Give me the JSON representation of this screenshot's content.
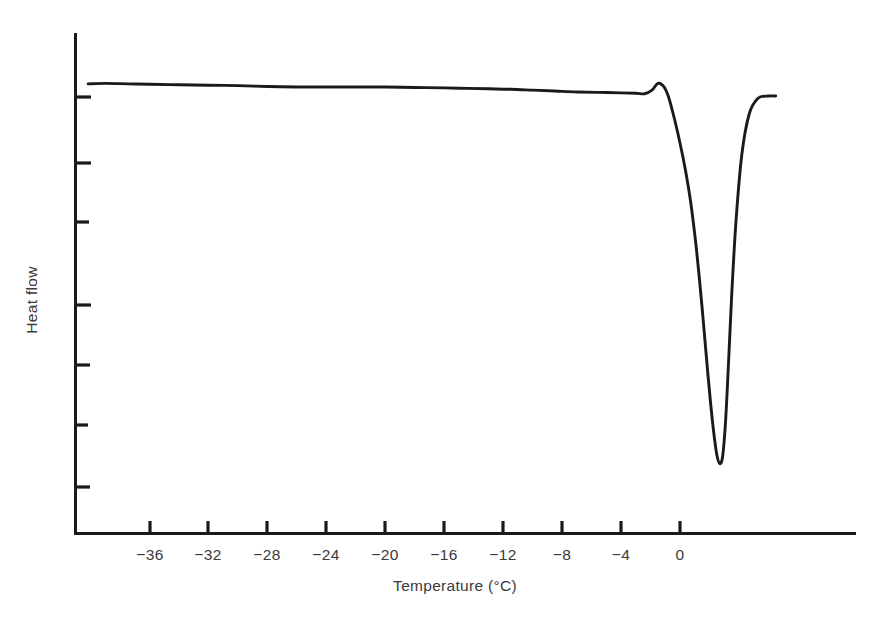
{
  "chart_data": {
    "type": "line",
    "title": "",
    "subtitle": "",
    "xlabel": "Temperature (°C)",
    "ylabel": "Heat flow",
    "xlim": [
      -40.8,
      6.9
    ],
    "ylim": [
      0,
      1
    ],
    "grid": false,
    "legend": null,
    "annotations": [],
    "x_ticks": [
      -36,
      -32,
      -28,
      -24,
      -20,
      -16,
      -12,
      -8,
      -4,
      0
    ],
    "x_tick_labels": [
      "−36",
      "−32",
      "−28",
      "−24",
      "−20",
      "−16",
      "−12",
      "−8",
      "−4",
      "0"
    ],
    "y_ticks_unlabeled_count": 7,
    "y_tick_labels": [],
    "line_color": "#1a1a1a",
    "series": [
      {
        "name": "Heat flow",
        "x": [
          -40.2,
          -39.0,
          -37.5,
          -36.0,
          -34.0,
          -32.0,
          -30.0,
          -28.0,
          -26.0,
          -24.0,
          -22.0,
          -20.0,
          -18.0,
          -16.0,
          -14.5,
          -13.0,
          -11.5,
          -10.0,
          -8.5,
          -7.0,
          -5.5,
          -4.0,
          -3.0,
          -2.4,
          -1.9,
          -1.5,
          -1.1,
          -0.8,
          -0.5,
          -0.2,
          0.1,
          0.4,
          0.7,
          0.9,
          1.1,
          1.3,
          1.5,
          1.7,
          1.9,
          2.1,
          2.3,
          2.5,
          2.7,
          2.9,
          3.1,
          3.3,
          3.5,
          3.8,
          4.2,
          4.7,
          5.3,
          6.0,
          6.5
        ],
        "y": [
          0.947,
          0.948,
          0.947,
          0.946,
          0.945,
          0.944,
          0.943,
          0.941,
          0.94,
          0.94,
          0.94,
          0.94,
          0.939,
          0.938,
          0.937,
          0.936,
          0.935,
          0.933,
          0.931,
          0.929,
          0.928,
          0.927,
          0.926,
          0.925,
          0.933,
          0.948,
          0.941,
          0.92,
          0.885,
          0.845,
          0.8,
          0.75,
          0.69,
          0.64,
          0.585,
          0.52,
          0.45,
          0.375,
          0.3,
          0.23,
          0.17,
          0.123,
          0.103,
          0.12,
          0.2,
          0.33,
          0.47,
          0.64,
          0.79,
          0.88,
          0.915,
          0.92,
          0.92
        ]
      }
    ],
    "features": {
      "baseline_level": "flat, very slight downward drift from left to right",
      "exotherm_bump": {
        "temperature_c": -1.5,
        "description": "small sharp upward spike just before the main transition"
      },
      "endotherm_minimum": {
        "temperature_c": 1.0,
        "description": "deep narrow downward melting peak"
      },
      "recovery_plateau": {
        "temperature_c": 5.0,
        "description": "curve returns to a flat plateau slightly below the original baseline"
      }
    }
  },
  "axis": {
    "x_title": "Temperature (°C)",
    "y_title": "Heat flow"
  },
  "ticks": {
    "x": [
      {
        "label": "−36",
        "px": 150
      },
      {
        "label": "−32",
        "px": 208
      },
      {
        "label": "−28",
        "px": 267
      },
      {
        "label": "−24",
        "px": 326
      },
      {
        "label": "−20",
        "px": 385
      },
      {
        "label": "−16",
        "px": 444
      },
      {
        "label": "−12",
        "px": 503
      },
      {
        "label": "−8",
        "px": 562
      },
      {
        "label": "−4",
        "px": 621
      },
      {
        "label": "0",
        "px": 680
      }
    ]
  }
}
